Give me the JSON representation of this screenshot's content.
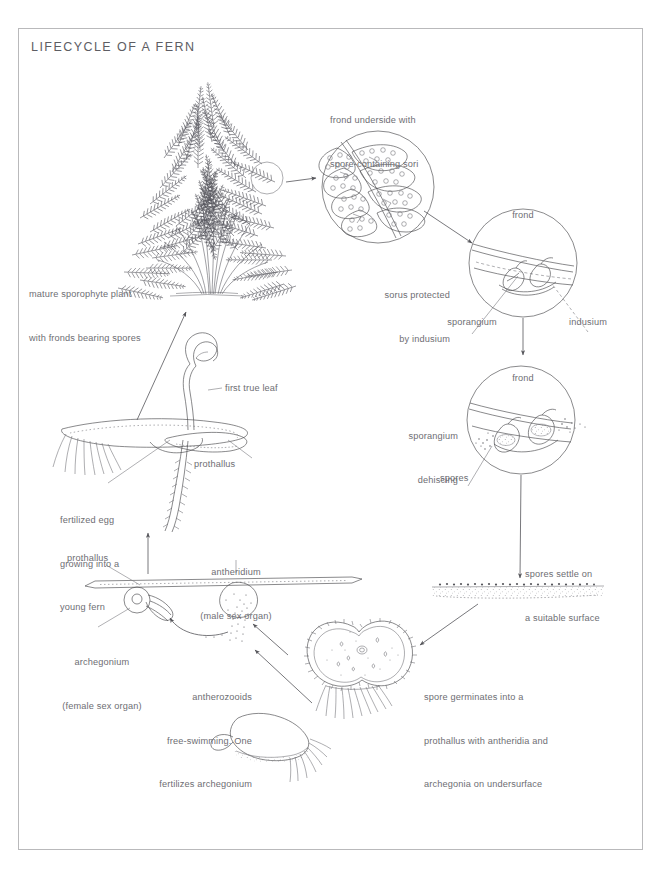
{
  "page": {
    "title": "LIFECYCLE OF A FERN",
    "background": "#ffffff",
    "border_color": "#b9b9bb",
    "ink_color": "#4a4a4e",
    "text_color": "#6e6e73"
  },
  "diagram": {
    "type": "scientific-lifecycle-diagram",
    "subject": "fern",
    "stages": [
      {
        "id": "mature-sporophyte",
        "label": "mature sporophyte plant\nwith fronds bearing spores",
        "line1": "mature sporophyte plant",
        "line2": "with fronds bearing spores"
      },
      {
        "id": "frond-underside",
        "label": "frond underside with\nspore-containing sori",
        "line1": "frond underside with",
        "line2": "spore-containing sori"
      },
      {
        "id": "sorus-indusium",
        "label": "sorus protected\nby indusium",
        "line1": "sorus protected",
        "line2": "by indusium",
        "callouts": [
          "frond",
          "sporangium",
          "indusium"
        ]
      },
      {
        "id": "sporangium-dehiscing",
        "label": "sporangium\ndehiscing",
        "line1": "sporangium",
        "line2": "dehiscing",
        "callouts": [
          "frond",
          "spores"
        ]
      },
      {
        "id": "spores-settle",
        "label": "spores settle on\na suitable surface",
        "line1": "spores settle on",
        "line2": "a suitable surface"
      },
      {
        "id": "spore-germinates",
        "label": "spore germinates into a\nprothallus with antheridia and\narchegonia on undersurface",
        "line1": "spore germinates into a",
        "line2": "prothallus with antheridia and",
        "line3": "archegonia on undersurface"
      },
      {
        "id": "antherozooids",
        "label": "antherozooids\nfree-swimming. One\nfertilizes archegonium",
        "line1": "antherozooids",
        "line2": "free-swimming. One",
        "line3": "fertilizes archegonium"
      },
      {
        "id": "fertilized-egg",
        "label": "fertilized egg\ngrowing into a\nyoung fern",
        "line1": "fertilized egg",
        "line2": "growing into a",
        "line3": "young fern"
      }
    ],
    "callouts": {
      "frond_top": "frond",
      "frond_bottom": "frond",
      "sporangium": "sporangium",
      "indusium": "indusium",
      "spores": "spores",
      "first_true_leaf": "first true leaf",
      "prothallus_upper": "prothallus",
      "prothallus_lower": "prothallus",
      "antheridium_l1": "antheridium",
      "antheridium_l2": "(male sex organ)",
      "archegonium_l1": "archegonium",
      "archegonium_l2": "(female sex organ)"
    }
  }
}
